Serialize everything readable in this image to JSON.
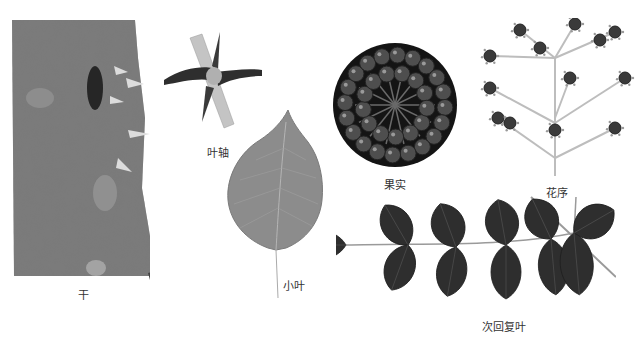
{
  "figure": {
    "panels": [
      {
        "id": "trunk",
        "label": "干",
        "icon": "bark-trunk-with-prickles"
      },
      {
        "id": "rachis",
        "label": "叶轴",
        "icon": "spiny-rachis"
      },
      {
        "id": "leaflet",
        "label": "小叶",
        "icon": "single-leaflet"
      },
      {
        "id": "fruit",
        "label": "果实",
        "icon": "fruit-cluster-circle"
      },
      {
        "id": "inflorescence",
        "label": "花序",
        "icon": "umbel-panicle"
      },
      {
        "id": "compound-leaf",
        "label": "次回复叶",
        "icon": "pinnate-compound-leaf"
      }
    ]
  },
  "colors": {
    "background": "#ffffff",
    "bark_dark": "#3a3a3a",
    "bark_mid": "#6e6e6e",
    "bark_light": "#9a9a9a",
    "leaflet_fill": "#8c8c8c",
    "leaf_dark": "#2e2e2e",
    "fruit_bg": "#141414",
    "berry": "#5a5a5a",
    "stem": "#b8b8b8",
    "label_text": "#333333"
  }
}
